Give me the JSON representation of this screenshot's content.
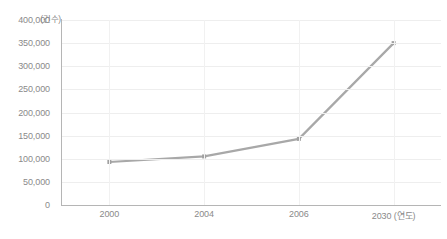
{
  "chart_data": {
    "type": "line",
    "title": "",
    "xlabel": "(연도)",
    "ylabel": "(건수)",
    "categories": [
      "2000",
      "2004",
      "2006",
      "2030"
    ],
    "values": [
      93000,
      105000,
      143000,
      350000
    ],
    "series": [
      {
        "name": "건수",
        "values": [
          93000,
          105000,
          143000,
          350000
        ]
      }
    ],
    "ylim": [
      0,
      400000
    ],
    "ytick_labels": [
      "0",
      "50,000",
      "100,000",
      "150,000",
      "200,000",
      "250,000",
      "300,000",
      "350,000",
      "400,000"
    ],
    "ytick_values": [
      0,
      50000,
      100000,
      150000,
      200000,
      250000,
      300000,
      350000,
      400000
    ],
    "xtick_labels": [
      "2000",
      "2004",
      "2006",
      "2030"
    ],
    "x_axis_unit_suffix": "(연도)",
    "grid": true,
    "grid_horizontal": true,
    "grid_vertical": true,
    "legend": false,
    "legend_position": "none",
    "marker": "square",
    "line_color": "#a8a8a8",
    "marker_color": "#a0a0a0",
    "grid_color": "#eeeeee",
    "axis_color": "#b5b5b5",
    "tick_label_color": "#8a8a8a",
    "background_color": "#ffffff"
  }
}
